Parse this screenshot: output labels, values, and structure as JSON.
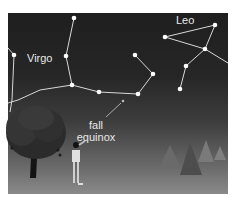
{
  "figure": {
    "background_color": "#ffffff",
    "sky_top_color": "#1f1f1f",
    "ground_color": "#8a8a8a",
    "line_color": "#d8d8d8",
    "star_color": "#ffffff"
  },
  "labels": {
    "virgo": "Virgo",
    "leo": "Leo",
    "equinox_line1": "fall",
    "equinox_line2": "equinox"
  },
  "constellations": {
    "virgo": {
      "name": "Virgo",
      "stars": [
        [
          74,
          18
        ],
        [
          66,
          56
        ],
        [
          72,
          85
        ],
        [
          99,
          92
        ],
        [
          138,
          94
        ],
        [
          153,
          74
        ],
        [
          135,
          55
        ],
        [
          14,
          55
        ]
      ]
    },
    "leo": {
      "name": "Leo",
      "stars": [
        [
          165,
          37
        ],
        [
          215,
          25
        ],
        [
          205,
          49
        ],
        [
          186,
          66
        ],
        [
          180,
          89
        ]
      ]
    }
  },
  "annotation": {
    "fall_equinox_point": [
      123,
      101
    ]
  },
  "illustrations": [
    "tree",
    "person-pointing",
    "pine-trees"
  ]
}
